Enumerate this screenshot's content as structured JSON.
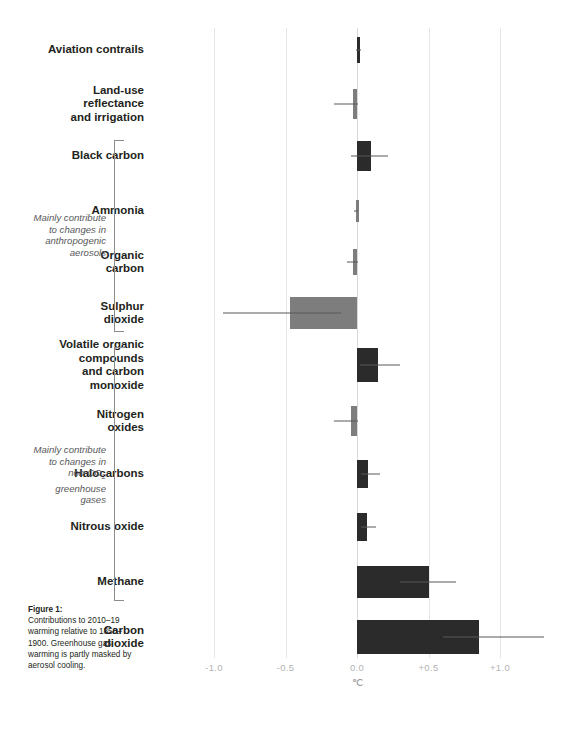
{
  "figure": {
    "caption_title": "Figure 1:",
    "caption_body": "Contributions to 2010–19 warming relative to 1850–1900. Greenhouse gas warming is partly masked by aerosol cooling."
  },
  "axis": {
    "unit": "℃",
    "ticks": [
      {
        "label": "-1.0",
        "value": -1.0
      },
      {
        "label": "-0.5",
        "value": -0.5
      },
      {
        "label": "0.0",
        "value": 0.0
      },
      {
        "label": "+0.5",
        "value": 0.5
      },
      {
        "label": "+1.0",
        "value": 1.0
      }
    ]
  },
  "groups": [
    {
      "id": "anthropogenic-aerosols",
      "note": "Mainly contribute to changes in anthropogenic aerosols",
      "note_lines": [
        "Mainly contribute",
        "to changes in",
        "anthropogenic",
        "aerosols"
      ],
      "first_index": 2,
      "last_index": 5
    },
    {
      "id": "non-co2-greenhouse-gases",
      "note": "Mainly contribute to changes in non-CO2 greenhouse gases",
      "note_lines": [
        "Mainly contribute",
        "to changes in",
        "non-CO₂",
        "greenhouse",
        "gases"
      ],
      "first_index": 6,
      "last_index": 10
    }
  ],
  "colors": {
    "warming_bar": "#2b2b2b",
    "cooling_bar": "#7d7d7d",
    "whisker": "#58585a",
    "gridline": "#e6e6e6",
    "tick_text": "#b3b3b3",
    "label_text": "#231f20",
    "note_text": "#58585a"
  },
  "chart_data": {
    "type": "bar",
    "orientation": "horizontal",
    "title": "",
    "xlabel": "℃",
    "ylabel": "",
    "xlim": [
      -1.25,
      1.45
    ],
    "grid": true,
    "legend": "none",
    "categories": [
      "Aviation contrails",
      "Land-use reflectance and irrigation",
      "Black carbon",
      "Ammonia",
      "Organic carbon",
      "Sulphur dioxide",
      "Volatile organic compounds and carbon monoxide",
      "Nitrogen oxides",
      "Halocarbons",
      "Nitrous oxide",
      "Methane",
      "Carbon dioxide"
    ],
    "category_lines": [
      [
        "Aviation contrails"
      ],
      [
        "Land-use",
        "reflectance",
        "and irrigation"
      ],
      [
        "Black carbon"
      ],
      [
        "Ammonia"
      ],
      [
        "Organic",
        "carbon"
      ],
      [
        "Sulphur",
        "dioxide"
      ],
      [
        "Volatile organic",
        "compounds",
        "and carbon",
        "monoxide"
      ],
      [
        "Nitrogen",
        "oxides"
      ],
      [
        "Halocarbons"
      ],
      [
        "Nitrous oxide"
      ],
      [
        "Methane"
      ],
      [
        "Carbon",
        "dioxide"
      ]
    ],
    "values": [
      0.01,
      -0.03,
      0.1,
      -0.01,
      -0.03,
      -0.47,
      0.15,
      -0.04,
      0.08,
      0.07,
      0.5,
      0.85
    ],
    "error_low": [
      -0.01,
      -0.16,
      -0.04,
      -0.02,
      -0.07,
      -0.94,
      0.02,
      -0.16,
      0.03,
      0.03,
      0.3,
      0.6
    ],
    "error_high": [
      0.03,
      0.01,
      0.22,
      0.01,
      0.01,
      -0.11,
      0.3,
      0.01,
      0.16,
      0.13,
      0.69,
      1.31
    ],
    "bar_colors": [
      "warm",
      "cool",
      "warm",
      "cool",
      "cool",
      "cool",
      "warm",
      "cool",
      "warm",
      "warm",
      "warm",
      "warm"
    ]
  }
}
